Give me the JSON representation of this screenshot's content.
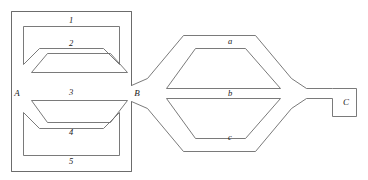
{
  "figure": {
    "stroke_color": "#6b6b6b",
    "label_color": "#1a1a1a",
    "background_color": "#ffffff",
    "width": 368,
    "height": 180
  },
  "nodes": [
    {
      "id": "A",
      "label": "A",
      "x": 17,
      "y": 93
    },
    {
      "id": "B",
      "label": "B",
      "x": 136,
      "y": 93
    },
    {
      "id": "C",
      "label": "C",
      "x": 349,
      "y": 102
    }
  ],
  "left_block": {
    "name": "left-branch-group",
    "outer_rect": {
      "x": 11,
      "y": 11,
      "width": 121,
      "height": 160
    },
    "branches": [
      {
        "id": "1",
        "label": "1",
        "label_x": 71,
        "label_y": 21,
        "shape": "rounded-rect-channel"
      },
      {
        "id": "2",
        "label": "2",
        "label_x": 71,
        "label_y": 46,
        "shape": "trapezoid-channel"
      },
      {
        "id": "3",
        "label": "3",
        "label_x": 71,
        "label_y": 92,
        "shape": "trapezoid-channel"
      },
      {
        "id": "4",
        "label": "4",
        "label_x": 71,
        "label_y": 131,
        "shape": "trapezoid-channel"
      },
      {
        "id": "5",
        "label": "5",
        "label_x": 71,
        "label_y": 160,
        "shape": "rounded-rect-channel"
      }
    ]
  },
  "right_block": {
    "name": "right-branch-group",
    "branches": [
      {
        "id": "a",
        "label": "a",
        "label_x": 230,
        "label_y": 41,
        "shape": "hexagon-outer-upper"
      },
      {
        "id": "b",
        "label": "b",
        "label_x": 230,
        "label_y": 92,
        "shape": "trapezoid-inner"
      },
      {
        "id": "c",
        "label": "c",
        "label_x": 230,
        "label_y": 137,
        "shape": "trapezoid-lower"
      }
    ]
  },
  "terminal_c": {
    "name": "terminal-c-box",
    "rect": {
      "x": 332,
      "y": 88,
      "width": 24,
      "height": 28
    }
  },
  "paths": {
    "left_outer_rect": "M 11 11 L 131 11 L 131 85 L 142 93 L 131 101 L 131 171 L 11 171 Z",
    "branch_1_channel": "M 24 24 L 119 24 L 119 62 L 104 47 L 39 47 L 24 62 Z",
    "branch_2_channel": "M 31 68 L 48 52 L 110 52 L 127 68 Z",
    "branch_3_channel": "M 31 111 L 48 127 L 110 127 L 127 111 Z",
    "branch_4_channel": "M 24 119 L 39 134 L 104 134 L 119 119 L 119 157 L 24 157 Z",
    "hex_outer": "M 142 85 L 176 46 L 244 46 L 278 85 L 311 85 L 331 93 L 331 89 L 356 89 L 356 116 L 331 116 L 331 109 L 311 109 L 278 109 L 244 148 L 176 148 L 142 101 Z",
    "hex_inner_upper": "M 155 85 L 185 55 L 237 55 L 270 85 Z",
    "hex_inner_lower": "M 155 101 L 185 131 L 237 131 L 270 101 Z",
    "terminal_box": "M 332 88 L 356 88 L 356 116 L 332 116 Z"
  }
}
